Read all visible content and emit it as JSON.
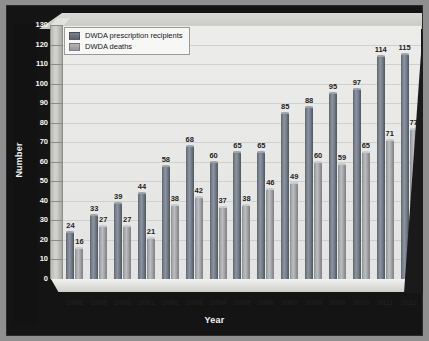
{
  "chart_data": {
    "type": "bar",
    "title": "",
    "subtitle": "",
    "xlabel": "Year",
    "ylabel": "Number",
    "categories": [
      "1998",
      "1999",
      "2000",
      "2001",
      "2002",
      "2003",
      "2004",
      "2005",
      "2006",
      "2007",
      "2008",
      "2009",
      "2010",
      "2011",
      "2012"
    ],
    "series": [
      {
        "name": "DWDA prescription recipients",
        "color": "#6e7883",
        "values": [
          24,
          33,
          39,
          44,
          58,
          68,
          60,
          65,
          65,
          85,
          88,
          95,
          97,
          114,
          115
        ]
      },
      {
        "name": "DWDA deaths",
        "color": "#a9abaf",
        "values": [
          16,
          27,
          27,
          21,
          38,
          42,
          37,
          38,
          46,
          49,
          60,
          59,
          65,
          71,
          77
        ]
      }
    ],
    "ylim": [
      0,
      130
    ],
    "ytick_step": 10,
    "yticks": [
      0,
      10,
      20,
      30,
      40,
      50,
      60,
      70,
      80,
      90,
      100,
      110,
      120,
      130
    ],
    "grid": "horizontal",
    "legend_position": "top-left",
    "data_labels": true,
    "style": "3d-cylinder-bars"
  },
  "legend": {
    "items": [
      {
        "label": "DWDA prescription recipients"
      },
      {
        "label": "DWDA deaths"
      }
    ]
  },
  "axes": {
    "y_title": "Number",
    "x_title": "Year"
  },
  "colors": {
    "background": "#8f8f8f",
    "panel": "#141414",
    "plot_area": "#ececeb",
    "gridline": "#cfcfcd",
    "series_1": "#6e7883",
    "series_2": "#a9abaf",
    "axis_text_light": "#fafafa",
    "axis_text_dark": "#1f1f1f"
  }
}
